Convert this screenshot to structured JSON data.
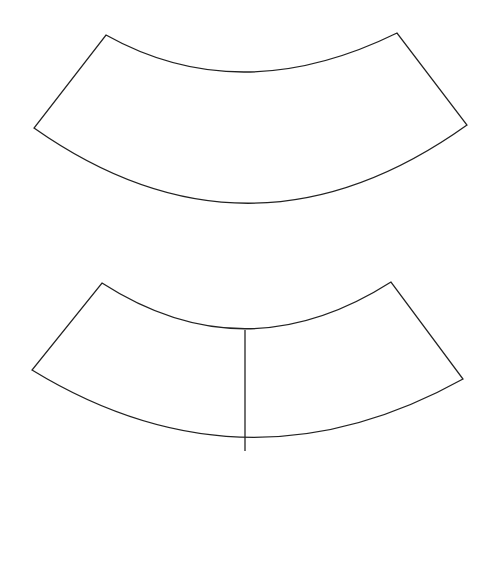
{
  "figure": {
    "caption": "Fig. 92",
    "panels": [
      {
        "label": "a",
        "description": "Curved annular sector hatched entirely with slightly inclined horizontal lines",
        "hatch": "horizontal",
        "corners": {
          "top_left": [
            106,
            35
          ],
          "left": [
            34,
            128
          ],
          "top_right": [
            397,
            33
          ],
          "right": [
            467,
            125
          ]
        },
        "inner_arc_lowest_y": 78,
        "outer_arc_lowest_y": 203,
        "hatch_line_count": 14
      },
      {
        "label": "b",
        "description": "Same curved sector divided by a vertical line; left part hatched vertically, right part hatched horizontally",
        "hatch_left": "vertical",
        "hatch_right": "horizontal",
        "corners": {
          "top_left": [
            102,
            283
          ],
          "left": [
            32,
            370
          ],
          "top_right": [
            391,
            282
          ],
          "right": [
            463,
            379
          ]
        },
        "divider_x": 245,
        "divider_y_range": [
          330,
          451
        ],
        "inner_arc_lowest_y": 330,
        "outer_arc_lowest_y": 451,
        "vertical_hatch_line_count": 16,
        "horizontal_hatch_line_count": 13
      }
    ]
  },
  "colors": {
    "stroke": "#222222",
    "background": "#ffffff"
  }
}
